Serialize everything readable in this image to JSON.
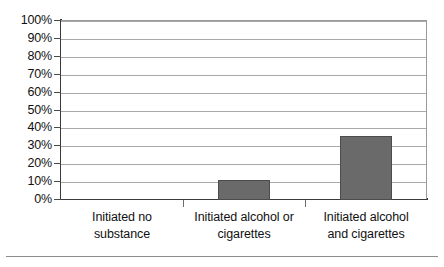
{
  "chart_data": {
    "type": "bar",
    "title": "",
    "subtitle": "",
    "xlabel": "",
    "ylabel": "",
    "categories": [
      "Initiated no substance",
      "Initiated alcohol or cigarettes",
      "Initiated alcohol and cigarettes"
    ],
    "category_lines": [
      [
        "Initiated no",
        "substance"
      ],
      [
        "Initiated alcohol or",
        "cigarettes"
      ],
      [
        "Initiated alcohol",
        "and cigarettes"
      ]
    ],
    "values": [
      0,
      11,
      36
    ],
    "value_labels": [
      "0%",
      "11%",
      "36%"
    ],
    "ylim": [
      0,
      100
    ],
    "ytick_values": [
      0,
      10,
      20,
      30,
      40,
      50,
      60,
      70,
      80,
      90,
      100
    ],
    "ytick_labels": [
      "0%",
      "10%",
      "20%",
      "30%",
      "40%",
      "50%",
      "60%",
      "70%",
      "80%",
      "90%",
      "100%"
    ],
    "grid": true,
    "legend": null,
    "legend_position": "none",
    "bar_color": "#6a6a6a",
    "bar_border_color": "#4c4c4c",
    "gridline_color": "#a8a8a8",
    "axis_color": "#3a3a3a",
    "plot_background": "#ffffff"
  },
  "figure": {
    "background": "#ffffff",
    "footer_rule_color": "#8d8d8d"
  }
}
